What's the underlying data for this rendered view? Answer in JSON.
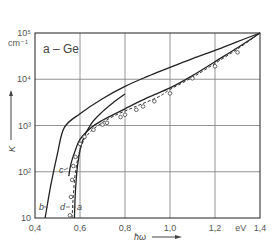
{
  "chart_data": {
    "type": "line",
    "title": "a – Ge",
    "xlabel": "ħω",
    "xunit": "eV",
    "ylabel": "K",
    "yunit": "cm⁻¹",
    "yscale": "log",
    "xlim": [
      0.4,
      1.4
    ],
    "ylim": [
      10,
      100000
    ],
    "grid": true,
    "x_ticks": [
      "0,4",
      "0,6",
      "0,8",
      "1,0",
      "1,2",
      "eV",
      "1,4"
    ],
    "y_ticks": [
      "10",
      "10²",
      "10³",
      "10⁴",
      "10⁵"
    ],
    "y_unit_label": "cm⁻¹",
    "series": [
      {
        "name": "b",
        "points": [
          [
            0.445,
            10
          ],
          [
            0.47,
            50
          ],
          [
            0.5,
            250
          ],
          [
            0.53,
            900
          ],
          [
            0.6,
            1800
          ],
          [
            0.7,
            3800
          ],
          [
            0.8,
            7000
          ],
          [
            0.9,
            11500
          ],
          [
            1.0,
            18000
          ],
          [
            1.1,
            28000
          ],
          [
            1.2,
            42000
          ],
          [
            1.3,
            65000
          ],
          [
            1.4,
            100000
          ]
        ]
      },
      {
        "name": "a",
        "points": [
          [
            0.575,
            10
          ],
          [
            0.58,
            40
          ],
          [
            0.59,
            150
          ],
          [
            0.61,
            450
          ],
          [
            0.65,
            1100
          ],
          [
            0.7,
            2000
          ],
          [
            0.75,
            3200
          ],
          [
            0.8,
            4800
          ]
        ]
      },
      {
        "name": "c",
        "points": [
          [
            0.55,
            80
          ],
          [
            0.56,
            150
          ],
          [
            0.58,
            300
          ],
          [
            0.6,
            500
          ],
          [
            0.65,
            900
          ],
          [
            0.7,
            1300
          ],
          [
            0.8,
            2300
          ],
          [
            0.9,
            4000
          ],
          [
            1.0,
            6500
          ],
          [
            1.1,
            12000
          ],
          [
            1.2,
            24000
          ],
          [
            1.3,
            48000
          ],
          [
            1.4,
            100000
          ]
        ]
      },
      {
        "name": "d",
        "style": "dashed with circles",
        "points": [
          [
            0.565,
            10
          ],
          [
            0.57,
            30
          ],
          [
            0.58,
            100
          ],
          [
            0.6,
            300
          ],
          [
            0.63,
            600
          ],
          [
            0.68,
            1000
          ],
          [
            0.75,
            1600
          ],
          [
            0.85,
            2600
          ],
          [
            0.95,
            4200
          ],
          [
            1.0,
            6000
          ],
          [
            1.1,
            11000
          ],
          [
            1.2,
            22000
          ],
          [
            1.3,
            45000
          ],
          [
            1.4,
            100000
          ]
        ]
      }
    ],
    "data_points": [
      [
        0.555,
        12
      ],
      [
        0.56,
        30
      ],
      [
        0.565,
        70
      ],
      [
        0.57,
        140
      ],
      [
        0.58,
        220
      ],
      [
        0.6,
        420
      ],
      [
        0.62,
        600
      ],
      [
        0.66,
        850
      ],
      [
        0.7,
        1100
      ],
      [
        0.72,
        1200
      ],
      [
        0.78,
        1600
      ],
      [
        0.8,
        1800
      ],
      [
        0.85,
        2300
      ],
      [
        0.88,
        2700
      ],
      [
        0.93,
        3500
      ],
      [
        1.0,
        5200
      ],
      [
        1.1,
        11000
      ],
      [
        1.2,
        20000
      ],
      [
        1.3,
        40000
      ]
    ],
    "annotations": [
      "a",
      "b",
      "c",
      "d"
    ]
  }
}
